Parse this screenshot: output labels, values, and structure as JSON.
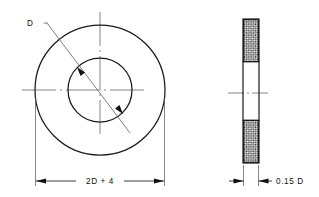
{
  "drawing": {
    "title": "Washer Technical Drawing",
    "views": {
      "front": {
        "name": "front-view",
        "outer_diameter_label": "2D + 4",
        "inner_diameter_label": "D"
      },
      "side": {
        "name": "side-section-view",
        "thickness_label": "0.15 D"
      }
    },
    "dimensions": [
      {
        "id": "outer-width",
        "text": "2D + 4",
        "placement": "bottom-front-view",
        "arrow_direction": "inward"
      },
      {
        "id": "bore-diameter",
        "text": "D",
        "placement": "upper-left-leader",
        "arrow_direction": "inward"
      },
      {
        "id": "thickness",
        "text": "0.15 D",
        "placement": "bottom-side-view",
        "arrow_direction": "outward"
      }
    ],
    "colors": {
      "line": "#1a1a1a",
      "thin_line": "#555555",
      "center_line": "#6f6f6f",
      "hatch": "#1a1a1a",
      "background": "#ffffff",
      "text": "#111111"
    },
    "geometry": {
      "front_center_x": 100,
      "front_center_y": 90,
      "outer_radius": 65,
      "inner_radius": 32,
      "side_left_x": 243,
      "side_right_x": 259,
      "side_top_y": 19,
      "side_bottom_y": 163
    }
  }
}
